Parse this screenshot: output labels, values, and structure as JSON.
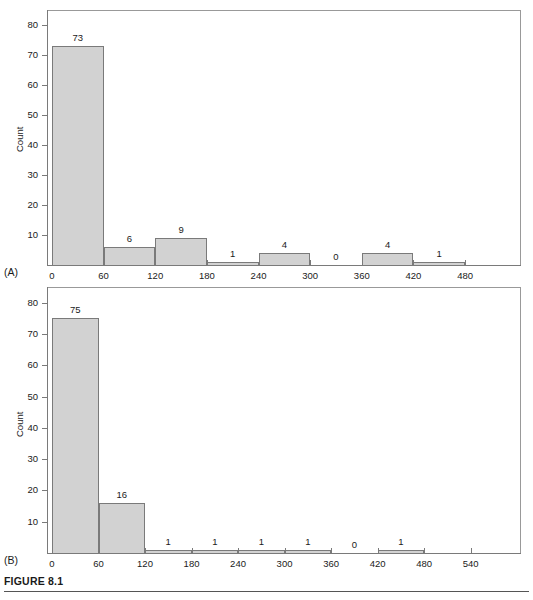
{
  "figure": {
    "caption": "FIGURE 8.1",
    "bar_fill_color": "#d2d2d2",
    "bar_stroke_color": "#7a7a7a",
    "axis_color": "#7a7a7a"
  },
  "panels": [
    {
      "tag": "(A)",
      "ylabel": "Count"
    },
    {
      "tag": "(B)",
      "ylabel": "Count"
    }
  ],
  "chart_data": [
    {
      "type": "bar",
      "title": "",
      "panel": "(A)",
      "xlabel": "",
      "ylabel": "Count",
      "bin_width": 60,
      "categories": [
        "0-60",
        "60-120",
        "120-180",
        "180-240",
        "240-300",
        "300-360",
        "360-420",
        "420-480"
      ],
      "bin_edges": [
        0,
        60,
        120,
        180,
        240,
        300,
        360,
        420,
        480
      ],
      "values": [
        73,
        6,
        9,
        1,
        4,
        0,
        4,
        1
      ],
      "data_labels": [
        "73",
        "6",
        "9",
        "1",
        "4",
        "0",
        "4",
        "1"
      ],
      "xticks": [
        0,
        60,
        120,
        180,
        240,
        300,
        360,
        420,
        480
      ],
      "xtick_labels": [
        "0",
        "60",
        "120",
        "180",
        "240",
        "300",
        "360",
        "420",
        "480"
      ],
      "yticks": [
        10,
        20,
        30,
        40,
        50,
        60,
        70,
        80
      ],
      "ytick_labels": [
        "10",
        "20",
        "30",
        "40",
        "50",
        "60",
        "70",
        "80"
      ],
      "xlim": [
        0,
        545
      ],
      "ylim": [
        0,
        85
      ],
      "grid": false,
      "legend": false
    },
    {
      "type": "bar",
      "title": "",
      "panel": "(B)",
      "xlabel": "",
      "ylabel": "Count",
      "bin_width": 60,
      "categories": [
        "0-60",
        "60-120",
        "120-180",
        "180-240",
        "240-300",
        "300-360",
        "360-420",
        "420-480"
      ],
      "bin_edges": [
        0,
        60,
        120,
        180,
        240,
        300,
        360,
        420,
        480
      ],
      "values": [
        75,
        16,
        1,
        1,
        1,
        1,
        0,
        1
      ],
      "data_labels": [
        "75",
        "16",
        "1",
        "1",
        "1",
        "1",
        "0",
        "1"
      ],
      "xticks": [
        0,
        60,
        120,
        180,
        240,
        300,
        360,
        420,
        480,
        540
      ],
      "xtick_labels": [
        "0",
        "60",
        "120",
        "180",
        "240",
        "300",
        "360",
        "420",
        "480",
        "540"
      ],
      "yticks": [
        10,
        20,
        30,
        40,
        50,
        60,
        70,
        80
      ],
      "ytick_labels": [
        "10",
        "20",
        "30",
        "40",
        "50",
        "60",
        "70",
        "80"
      ],
      "xlim": [
        0,
        605
      ],
      "ylim": [
        0,
        85
      ],
      "grid": false,
      "legend": false
    }
  ]
}
